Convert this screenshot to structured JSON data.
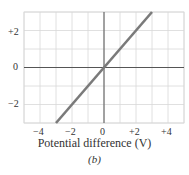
{
  "chart_data": {
    "type": "line",
    "title": "",
    "xlabel": "Potential difference (V)",
    "ylabel": "",
    "caption": "(b)",
    "xlim": [
      -5,
      5
    ],
    "ylim": [
      -3,
      3
    ],
    "grid": true,
    "x_ticks": [
      "-4",
      "-2",
      "0",
      "+2",
      "+4"
    ],
    "y_ticks": [
      "+2",
      "0",
      "-2"
    ],
    "series": [
      {
        "name": "current",
        "x": [
          -3,
          3
        ],
        "y": [
          -3,
          3
        ],
        "color": "#7a7a7a"
      }
    ]
  },
  "labels": {
    "xlabel": "Potential difference (V)",
    "caption": "(b)",
    "x_ticks": [
      "−4",
      "−2",
      "0",
      "+2",
      "+4"
    ],
    "y_ticks": [
      "+2",
      "0",
      "−2"
    ]
  }
}
